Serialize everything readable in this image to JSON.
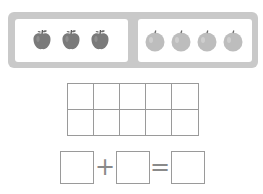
{
  "colors": {
    "frame": "#c9c9c9",
    "panel": "#ffffff",
    "apple": "#7a7a7a",
    "apple_highlight": "#9a9a9a",
    "orange": "#bdbdbd",
    "orange_highlight": "#d2d2d2",
    "stem": "#5a5a5a",
    "grid_line": "#9a9a9a"
  },
  "left_group": {
    "label": "apples",
    "count": 3,
    "items": [
      {
        "type": "apple",
        "cx": 42
      },
      {
        "type": "apple",
        "cx": 71
      },
      {
        "type": "apple",
        "cx": 100
      }
    ]
  },
  "right_group": {
    "label": "oranges",
    "count": 4,
    "items": [
      {
        "type": "orange",
        "cx": 155
      },
      {
        "type": "orange",
        "cx": 181
      },
      {
        "type": "orange",
        "cx": 207
      },
      {
        "type": "orange",
        "cx": 233
      }
    ]
  },
  "ten_frame": {
    "rows": 2,
    "cols": 5,
    "cells": [
      "",
      "",
      "",
      "",
      "",
      "",
      "",
      "",
      "",
      ""
    ]
  },
  "equation": {
    "box1": "",
    "operator1": "+",
    "box2": "",
    "operator2": "=",
    "box3": ""
  }
}
